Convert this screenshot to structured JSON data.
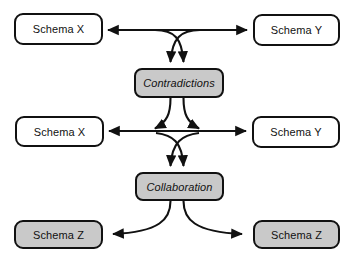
{
  "diagram": {
    "colors": {
      "background": "#ffffff",
      "stroke": "#111111",
      "shaded_fill": "#c9c9c9",
      "plain_fill": "#ffffff"
    },
    "nodes": [
      {
        "id": "schema-x-top",
        "label": "Schema X",
        "style": "plain",
        "x": 14,
        "y": 13,
        "w": 89,
        "h": 32
      },
      {
        "id": "schema-y-top",
        "label": "Schema Y",
        "style": "plain",
        "x": 253,
        "y": 14,
        "w": 87,
        "h": 32
      },
      {
        "id": "contradictions",
        "label": "Contradictions",
        "style": "process",
        "x": 134,
        "y": 68,
        "w": 90,
        "h": 30
      },
      {
        "id": "schema-x-mid",
        "label": "Schema X",
        "style": "plain",
        "x": 15,
        "y": 116,
        "w": 89,
        "h": 31
      },
      {
        "id": "schema-y-mid",
        "label": "Schema Y",
        "style": "plain",
        "x": 252,
        "y": 116,
        "w": 88,
        "h": 32
      },
      {
        "id": "collaboration",
        "label": "Collaboration",
        "style": "process",
        "x": 135,
        "y": 172,
        "w": 89,
        "h": 29
      },
      {
        "id": "schema-z-left",
        "label": "Schema Z",
        "style": "shaded",
        "x": 14,
        "y": 220,
        "w": 89,
        "h": 29
      },
      {
        "id": "schema-z-right",
        "label": "Schema Z",
        "style": "shaded",
        "x": 253,
        "y": 220,
        "w": 87,
        "h": 29
      }
    ],
    "edges": [
      {
        "id": "top-row-left-arrow",
        "from": "center-top",
        "to": "schema-x-top",
        "kind": "horizontal-arrow-left"
      },
      {
        "id": "top-row-right-arrow",
        "from": "center-top",
        "to": "schema-y-top",
        "kind": "horizontal-arrow-right"
      },
      {
        "id": "to-contradictions-left",
        "from": "schema-y-top",
        "to": "contradictions",
        "kind": "curve-down-arrow"
      },
      {
        "id": "to-contradictions-right",
        "from": "schema-x-top",
        "to": "contradictions",
        "kind": "curve-down-arrow"
      },
      {
        "id": "contradictions-out-left",
        "from": "contradictions",
        "to": "schema-x-mid",
        "kind": "curve-splay-left-arrow"
      },
      {
        "id": "contradictions-out-right",
        "from": "contradictions",
        "to": "schema-y-mid",
        "kind": "curve-splay-right-arrow"
      },
      {
        "id": "mid-row-left-arrow",
        "from": "center-mid",
        "to": "schema-x-mid",
        "kind": "horizontal-arrow-left"
      },
      {
        "id": "mid-row-right-arrow",
        "from": "center-mid",
        "to": "schema-y-mid",
        "kind": "horizontal-arrow-right"
      },
      {
        "id": "to-collaboration-left",
        "from": "schema-y-mid",
        "to": "collaboration",
        "kind": "curve-down-arrow"
      },
      {
        "id": "to-collaboration-right",
        "from": "schema-x-mid",
        "to": "collaboration",
        "kind": "curve-down-arrow"
      },
      {
        "id": "collaboration-out-left",
        "from": "collaboration",
        "to": "schema-z-left",
        "kind": "curve-splay-left-arrow"
      },
      {
        "id": "collaboration-out-right",
        "from": "collaboration",
        "to": "schema-z-right",
        "kind": "curve-splay-right-arrow"
      }
    ]
  }
}
